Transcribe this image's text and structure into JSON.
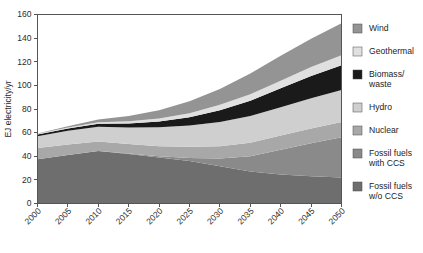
{
  "chart_data": {
    "type": "area",
    "stacked": true,
    "title": "",
    "xlabel": "",
    "ylabel": "EJ electricity/yr",
    "x": [
      2000,
      2005,
      2010,
      2015,
      2020,
      2025,
      2030,
      2035,
      2040,
      2045,
      2050
    ],
    "xtick_labels": [
      "2000",
      "2005",
      "2010",
      "2015",
      "2020",
      "2025",
      "2030",
      "2035",
      "2040",
      "2045",
      "2050"
    ],
    "ytick_labels": [
      "0",
      "20",
      "40",
      "60",
      "80",
      "100",
      "120",
      "140",
      "160"
    ],
    "ytick_values": [
      0,
      20,
      40,
      60,
      80,
      100,
      120,
      140,
      160
    ],
    "xlim": [
      2000,
      2050
    ],
    "ylim": [
      0,
      160
    ],
    "grid": false,
    "legend_position": "right",
    "series": [
      {
        "name": "Fossil fuels w/o CCS",
        "color": "#6e6e6e",
        "values": [
          37.5,
          41.0,
          44.5,
          42.0,
          39.0,
          36.0,
          31.5,
          27.0,
          24.5,
          23.0,
          22.0
        ]
      },
      {
        "name": "Fossil fuels with CCS",
        "color": "#8a8a8a",
        "values": [
          0.0,
          0.0,
          0.0,
          0.3,
          1.0,
          2.5,
          6.5,
          13.0,
          21.0,
          28.0,
          34.0
        ]
      },
      {
        "name": "Nuclear",
        "color": "#a8a8a8",
        "values": [
          9.5,
          9.0,
          8.0,
          8.0,
          8.5,
          9.5,
          10.5,
          11.5,
          12.0,
          12.5,
          13.0
        ]
      },
      {
        "name": "Hydro",
        "color": "#cfcfcf",
        "values": [
          10.0,
          11.5,
          12.5,
          14.0,
          16.0,
          18.0,
          20.5,
          22.5,
          24.0,
          25.5,
          27.0
        ]
      },
      {
        "name": "Biomass/waste",
        "color": "#1a1a1a",
        "values": [
          1.5,
          2.0,
          2.5,
          3.5,
          5.0,
          7.0,
          10.0,
          13.0,
          16.0,
          19.0,
          21.0
        ]
      },
      {
        "name": "Geothermal",
        "color": "#e0e0e0",
        "values": [
          0.5,
          0.8,
          1.2,
          1.8,
          2.5,
          3.5,
          4.5,
          5.5,
          6.5,
          7.5,
          8.5
        ]
      },
      {
        "name": "Wind",
        "color": "#949494",
        "values": [
          0.3,
          1.0,
          2.5,
          4.5,
          7.0,
          10.0,
          13.5,
          17.5,
          21.0,
          24.0,
          27.0
        ]
      }
    ]
  },
  "legend": {
    "items": [
      {
        "label": "Wind",
        "color": "#949494"
      },
      {
        "label": "Geothermal",
        "color": "#e0e0e0"
      },
      {
        "label": "Biomass/\nwaste",
        "color": "#1a1a1a"
      },
      {
        "label": "Hydro",
        "color": "#cfcfcf"
      },
      {
        "label": "Nuclear",
        "color": "#a8a8a8"
      },
      {
        "label": "Fossil fuels\nwith CCS",
        "color": "#8a8a8a"
      },
      {
        "label": "Fossil fuels\nw/o CCS",
        "color": "#6e6e6e"
      }
    ]
  },
  "axes": {
    "y_title": "EJ electricity/yr"
  }
}
